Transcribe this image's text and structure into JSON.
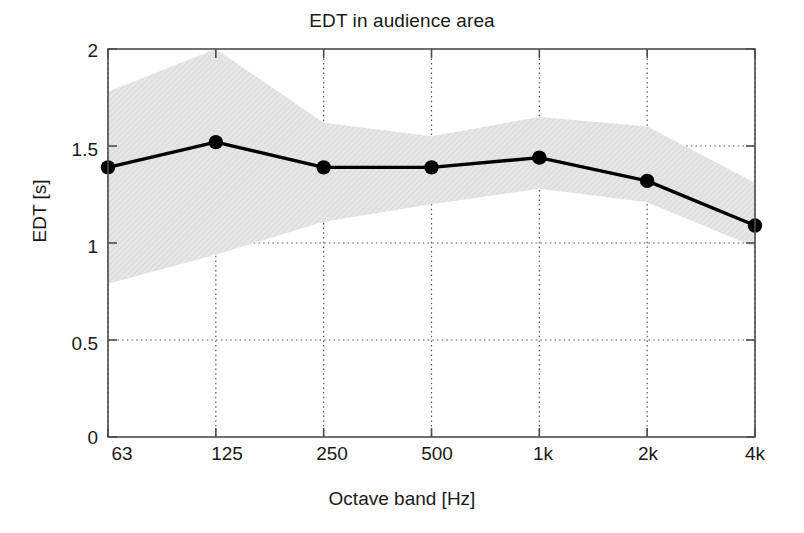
{
  "chart_data": {
    "type": "line",
    "title": "EDT in audience area",
    "xlabel": "Octave band [Hz]",
    "ylabel": "EDT [s]",
    "categories": [
      "63",
      "125",
      "250",
      "500",
      "1k",
      "2k",
      "4k"
    ],
    "xtick_labels": [
      "63",
      "125",
      "250",
      "500",
      "1k",
      "2k",
      "4k"
    ],
    "ytick_labels": [
      "0",
      "0.5",
      "1",
      "1.5",
      "2"
    ],
    "ytick_values": [
      0,
      0.5,
      1,
      1.5,
      2
    ],
    "ylim": [
      0,
      2
    ],
    "grid": true,
    "legend": null,
    "series": [
      {
        "name": "EDT mean",
        "values": [
          1.39,
          1.52,
          1.39,
          1.39,
          1.44,
          1.32,
          1.09
        ],
        "marker": "filled-circle",
        "color": "#000000"
      }
    ],
    "band": {
      "name": "spread",
      "upper": [
        1.78,
        2.0,
        1.62,
        1.55,
        1.65,
        1.6,
        1.31
      ],
      "lower": [
        0.79,
        0.94,
        1.11,
        1.2,
        1.28,
        1.21,
        0.98
      ],
      "color": "#e3e3e3"
    }
  },
  "colors": {
    "line": "#000000",
    "band": "#e3e3e3",
    "axis": "#4d4d4d",
    "grid": "#555555",
    "background": "#ffffff",
    "text": "#1a1a1a"
  }
}
